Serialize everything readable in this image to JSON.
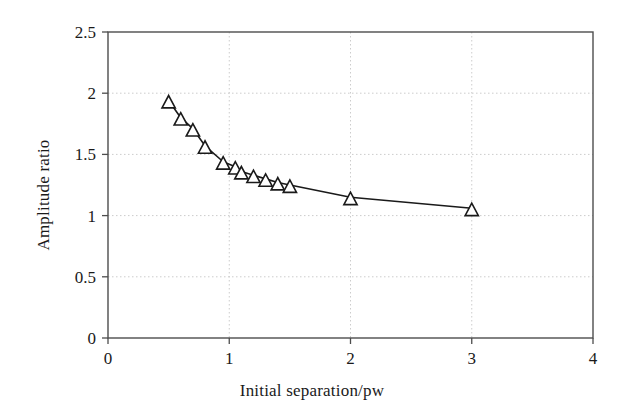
{
  "chart_data": {
    "type": "line",
    "title": "",
    "xlabel": "Initial separation/pw",
    "ylabel": "Amplitude ratio",
    "xlim": [
      0,
      4
    ],
    "ylim": [
      0,
      2.5
    ],
    "xticks": [
      "0",
      "1",
      "2",
      "3",
      "4"
    ],
    "xtick_values": [
      0,
      1,
      2,
      3,
      4
    ],
    "yticks": [
      "0",
      "0.5",
      "1",
      "1.5",
      "2",
      "2.5"
    ],
    "ytick_values": [
      0,
      0.5,
      1,
      1.5,
      2,
      2.5
    ],
    "grid": true,
    "grid_color": "#cccccc",
    "legend": null,
    "line_color": "#1a1a1a",
    "marker": "triangle-up",
    "marker_fill": "#ffffff",
    "marker_edge_color": "#1a1a1a",
    "series": [
      {
        "name": "Amplitude ratio",
        "x": [
          0.5,
          0.6,
          0.7,
          0.8,
          0.95,
          1.05,
          1.1,
          1.2,
          1.3,
          1.4,
          1.5,
          2.0,
          3.0
        ],
        "y": [
          1.94,
          1.8,
          1.71,
          1.57,
          1.44,
          1.4,
          1.36,
          1.33,
          1.3,
          1.27,
          1.25,
          1.15,
          1.06
        ]
      }
    ]
  }
}
